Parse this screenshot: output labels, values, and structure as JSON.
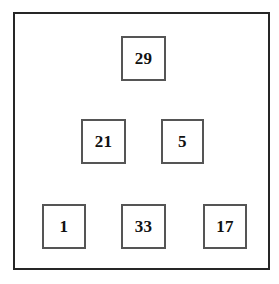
{
  "figure": {
    "background_color": "#ffffff",
    "frame": {
      "name": "outer-frame",
      "border_color": "#262626",
      "border_width_px": 2,
      "x": 13,
      "y": 12,
      "width": 257,
      "height": 258
    },
    "box_style": {
      "border_color": "#555555",
      "border_width_px": 2,
      "fill_color": "#ffffff",
      "text_color": "#111111"
    },
    "nodes": [
      {
        "label": "29",
        "x": 121,
        "y": 36,
        "width": 45,
        "height": 45,
        "row": 1
      },
      {
        "label": "21",
        "x": 81,
        "y": 119,
        "width": 45,
        "height": 45,
        "row": 2
      },
      {
        "label": "5",
        "x": 161,
        "y": 119,
        "width": 43,
        "height": 45,
        "row": 2
      },
      {
        "label": "1",
        "x": 42,
        "y": 204,
        "width": 44,
        "height": 45,
        "row": 3
      },
      {
        "label": "33",
        "x": 121,
        "y": 204,
        "width": 45,
        "height": 45,
        "row": 3
      },
      {
        "label": "17",
        "x": 203,
        "y": 204,
        "width": 44,
        "height": 45,
        "row": 3
      }
    ]
  }
}
